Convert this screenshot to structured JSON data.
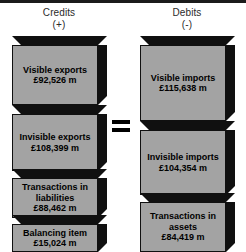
{
  "diagram": {
    "title_left": "Credits",
    "sign_left": "(+)",
    "title_right": "Debits",
    "sign_right": "(-)",
    "operator": "=",
    "colors": {
      "block_face": "#a3a3a3",
      "block_shadow": "#101010",
      "background": "#ffffff",
      "text": "#000000",
      "header_text": "#2b2b2b"
    },
    "credits": [
      {
        "name": "Visible exports",
        "amount": "£92,526 m",
        "value": 92526
      },
      {
        "name": "Invisible exports",
        "amount": "£108,399 m",
        "value": 108399
      },
      {
        "name": "Transactions in liabilities",
        "amount": "£88,462 m",
        "value": 88462
      },
      {
        "name": "Balancing item",
        "amount": "£15,024 m",
        "value": 15024
      }
    ],
    "debits": [
      {
        "name": "Visible imports",
        "amount": "£115,638 m",
        "value": 115638
      },
      {
        "name": "Invisible imports",
        "amount": "£104,354 m",
        "value": 104354
      },
      {
        "name": "Transactions in assets",
        "amount": "£84,419 m",
        "value": 84419
      }
    ]
  }
}
